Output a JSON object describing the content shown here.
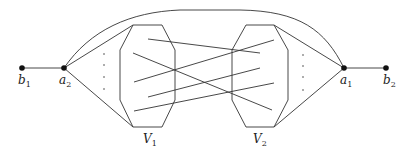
{
  "diagram": {
    "type": "graph",
    "vertices": [
      {
        "id": "b1",
        "label": "b",
        "sub": "1",
        "x": 22,
        "y": 68
      },
      {
        "id": "a2",
        "label": "a",
        "sub": "2",
        "x": 64,
        "y": 68
      },
      {
        "id": "a1",
        "label": "a",
        "sub": "1",
        "x": 344,
        "y": 68
      },
      {
        "id": "b2",
        "label": "b",
        "sub": "2",
        "x": 386,
        "y": 68
      }
    ],
    "sets": [
      {
        "id": "V1",
        "label": "V",
        "sub": "1"
      },
      {
        "id": "V2",
        "label": "V",
        "sub": "2"
      }
    ],
    "edges": [
      {
        "from": "b1",
        "to": "a2"
      },
      {
        "from": "a1",
        "to": "b2"
      },
      {
        "from": "a2",
        "to": "a1",
        "style": "arc-over-top"
      },
      {
        "from": "a2",
        "to": "V1",
        "style": "fan"
      },
      {
        "from": "a1",
        "to": "V2",
        "style": "fan"
      },
      {
        "from": "V1",
        "to": "V2",
        "style": "crossing-lines",
        "count": 5
      }
    ],
    "ellipsis_dots": {
      "left": 4,
      "right": 4
    }
  }
}
